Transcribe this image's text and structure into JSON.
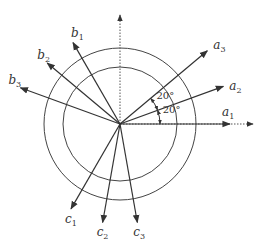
{
  "diagram": {
    "center": {
      "x": 120,
      "y": 124
    },
    "circles": {
      "outer_radius": 76,
      "inner_radius": 57
    },
    "reference_axes": [
      {
        "name": "vertical-reference",
        "direction": "up",
        "style": "dotted"
      },
      {
        "name": "horizontal-reference",
        "direction": "right",
        "style": "dotted"
      }
    ],
    "vectors": [
      {
        "id": "a1",
        "base": "a",
        "sub": "1",
        "angle_deg": 0,
        "length": 110
      },
      {
        "id": "a2",
        "base": "a",
        "sub": "2",
        "angle_deg": 20,
        "length": 110
      },
      {
        "id": "a3",
        "base": "a",
        "sub": "3",
        "angle_deg": 40,
        "length": 114
      },
      {
        "id": "b1",
        "base": "b",
        "sub": "1",
        "angle_deg": 120,
        "length": 94
      },
      {
        "id": "b2",
        "base": "b",
        "sub": "2",
        "angle_deg": 140,
        "length": 95
      },
      {
        "id": "b3",
        "base": "b",
        "sub": "3",
        "angle_deg": 160,
        "length": 106
      },
      {
        "id": "c1",
        "base": "c",
        "sub": "1",
        "angle_deg": 240,
        "length": 98
      },
      {
        "id": "c2",
        "base": "c",
        "sub": "2",
        "angle_deg": 260,
        "length": 100
      },
      {
        "id": "c3",
        "base": "c",
        "sub": "3",
        "angle_deg": 280,
        "length": 100
      }
    ],
    "angle_annotations": [
      {
        "label": "20°",
        "between": [
          "a3",
          "a2"
        ]
      },
      {
        "label": "20°",
        "between": [
          "a2",
          "a1"
        ]
      }
    ]
  }
}
